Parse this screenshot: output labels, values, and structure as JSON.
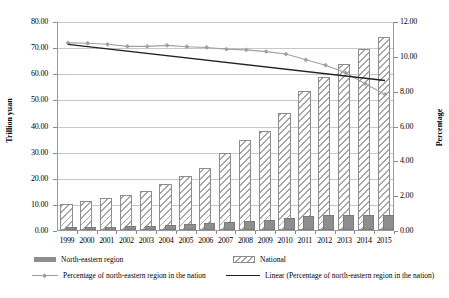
{
  "chart_data": {
    "type": "bar",
    "title": "",
    "xlabel": "",
    "ylabel": "Trillion yuan",
    "y2label": "Percentage",
    "ylim": [
      0,
      80
    ],
    "y2lim": [
      0,
      12
    ],
    "grid": true,
    "legend_position": "bottom",
    "categories": [
      "1999",
      "2000",
      "2001",
      "2002",
      "2003",
      "2004",
      "2005",
      "2006",
      "2007",
      "2008",
      "2009",
      "2010",
      "2011",
      "2012",
      "2013",
      "2014",
      "2015"
    ],
    "yticks": [
      "0.00",
      "10.00",
      "20.00",
      "30.00",
      "40.00",
      "50.00",
      "60.00",
      "70.00",
      "80.00"
    ],
    "y2ticks": [
      "0.00",
      "2.00",
      "4.00",
      "6.00",
      "8.00",
      "10.00",
      "12.00"
    ],
    "series": [
      {
        "name": "National",
        "type": "bar",
        "axis": "left",
        "values": [
          9.9,
          11.0,
          12.2,
          13.4,
          15.1,
          17.6,
          20.5,
          23.9,
          29.3,
          34.6,
          37.9,
          44.8,
          53.1,
          58.5,
          63.4,
          69.2,
          74.0
        ]
      },
      {
        "name": "North-eastern region",
        "type": "bar",
        "axis": "left",
        "values": [
          1.07,
          1.19,
          1.31,
          1.42,
          1.6,
          1.88,
          2.17,
          2.52,
          3.06,
          3.6,
          3.9,
          4.55,
          5.22,
          5.57,
          5.76,
          5.85,
          5.8
        ]
      },
      {
        "name": "Percentage of north-eastern region in the nation",
        "type": "line",
        "axis": "right",
        "values": [
          10.8,
          10.78,
          10.72,
          10.6,
          10.6,
          10.66,
          10.58,
          10.54,
          10.44,
          10.4,
          10.3,
          10.16,
          9.83,
          9.52,
          9.08,
          8.46,
          7.84
        ]
      },
      {
        "name": "Linear (Percentage of north-eastern region in the nation)",
        "type": "line",
        "axis": "right",
        "trend": true,
        "values": [
          10.72,
          10.59,
          10.46,
          10.33,
          10.2,
          10.07,
          9.94,
          9.81,
          9.68,
          9.55,
          9.42,
          9.29,
          9.16,
          9.03,
          8.9,
          8.77,
          8.64
        ]
      }
    ],
    "colors": {
      "north_eastern_bar": "#8e8e8e",
      "national_bar_hatch": "#a6a6a6",
      "percentage_line": "#a0a0a0",
      "trend_line": "#222222",
      "gridline": "#c8c8c8",
      "axis": "#9a9a9a"
    }
  },
  "axes": {
    "left_title": "Trillion yuan",
    "right_title": "Percentage"
  },
  "legend": {
    "items": [
      {
        "label": "North-eastern region",
        "marker": "filled-square-swatch"
      },
      {
        "label": "National",
        "marker": "hatched-square-swatch"
      },
      {
        "label": "Percentage of north-eastern region in the nation",
        "marker": "line-with-diamond-marker"
      },
      {
        "label": "Linear (Percentage of north-eastern region in the nation)",
        "marker": "solid-line"
      }
    ]
  }
}
